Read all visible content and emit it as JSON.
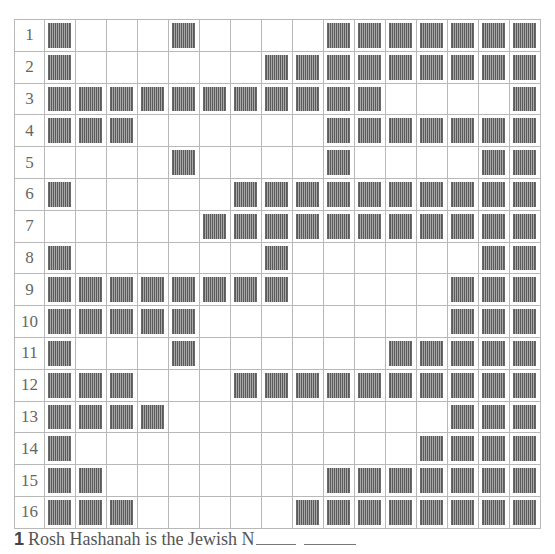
{
  "page": {
    "title_partial": "Crossword puzzle (title cut off at top)"
  },
  "grid": {
    "columns": 16,
    "rows": [
      {
        "label": "1",
        "shaded": [
          1,
          5,
          10,
          11,
          12,
          13,
          14,
          15,
          16
        ]
      },
      {
        "label": "2",
        "shaded": [
          1,
          8,
          9,
          10,
          11,
          12,
          13,
          14,
          15,
          16
        ]
      },
      {
        "label": "3",
        "shaded": [
          1,
          2,
          3,
          4,
          5,
          6,
          7,
          8,
          9,
          10,
          11,
          16
        ]
      },
      {
        "label": "4",
        "shaded": [
          1,
          2,
          3,
          10,
          11,
          12,
          13,
          14,
          15,
          16
        ]
      },
      {
        "label": "5",
        "shaded": [
          5,
          10,
          15,
          16
        ]
      },
      {
        "label": "6",
        "shaded": [
          1,
          7,
          8,
          9,
          10,
          11,
          12,
          13,
          14,
          15,
          16
        ]
      },
      {
        "label": "7",
        "shaded": [
          6,
          7,
          8,
          9,
          10,
          11,
          12,
          13,
          14,
          15,
          16
        ]
      },
      {
        "label": "8",
        "shaded": [
          1,
          8,
          15,
          16
        ]
      },
      {
        "label": "9",
        "shaded": [
          1,
          2,
          3,
          4,
          5,
          6,
          7,
          8,
          14,
          15,
          16
        ]
      },
      {
        "label": "10",
        "shaded": [
          1,
          2,
          3,
          4,
          5,
          14,
          15,
          16
        ]
      },
      {
        "label": "11",
        "shaded": [
          1,
          5,
          12,
          13,
          14,
          15,
          16
        ]
      },
      {
        "label": "12",
        "shaded": [
          1,
          2,
          3,
          7,
          8,
          9,
          10,
          11,
          12,
          13,
          14,
          15,
          16
        ]
      },
      {
        "label": "13",
        "shaded": [
          1,
          2,
          3,
          4,
          14,
          15,
          16
        ]
      },
      {
        "label": "14",
        "shaded": [
          1,
          13,
          14,
          15,
          16
        ]
      },
      {
        "label": "15",
        "shaded": [
          1,
          2,
          10,
          11,
          12,
          13,
          14,
          15,
          16
        ]
      },
      {
        "label": "16",
        "shaded": [
          1,
          2,
          3,
          9,
          10,
          11,
          12,
          13,
          14,
          15,
          16
        ]
      }
    ]
  },
  "clues": [
    {
      "number": "1",
      "text": "Rosh Hashanah is the Jewish N",
      "blanks": 2
    }
  ]
}
